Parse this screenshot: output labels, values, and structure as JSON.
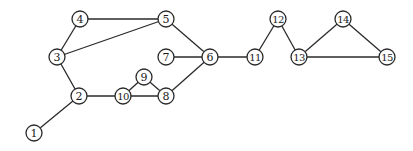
{
  "diagram": {
    "type": "undirected-graph",
    "nodes": [
      {
        "id": "1",
        "label": "1",
        "x": 34,
        "y": 133
      },
      {
        "id": "2",
        "label": "2",
        "x": 79,
        "y": 96
      },
      {
        "id": "3",
        "label": "3",
        "x": 57,
        "y": 57
      },
      {
        "id": "4",
        "label": "4",
        "x": 80,
        "y": 19
      },
      {
        "id": "5",
        "label": "5",
        "x": 166,
        "y": 19
      },
      {
        "id": "6",
        "label": "6",
        "x": 210,
        "y": 57
      },
      {
        "id": "7",
        "label": "7",
        "x": 166,
        "y": 57
      },
      {
        "id": "8",
        "label": "8",
        "x": 166,
        "y": 96
      },
      {
        "id": "9",
        "label": "9",
        "x": 144,
        "y": 77
      },
      {
        "id": "10",
        "label": "10",
        "x": 123,
        "y": 96
      },
      {
        "id": "11",
        "label": "11",
        "x": 255,
        "y": 57
      },
      {
        "id": "12",
        "label": "12",
        "x": 278,
        "y": 19
      },
      {
        "id": "13",
        "label": "13",
        "x": 299,
        "y": 57
      },
      {
        "id": "14",
        "label": "14",
        "x": 343,
        "y": 19
      },
      {
        "id": "15",
        "label": "15",
        "x": 387,
        "y": 57
      }
    ],
    "edges": [
      [
        "1",
        "2"
      ],
      [
        "2",
        "3"
      ],
      [
        "2",
        "10"
      ],
      [
        "3",
        "4"
      ],
      [
        "3",
        "5"
      ],
      [
        "4",
        "5"
      ],
      [
        "5",
        "6"
      ],
      [
        "6",
        "7"
      ],
      [
        "6",
        "8"
      ],
      [
        "6",
        "11"
      ],
      [
        "8",
        "10"
      ],
      [
        "9",
        "10"
      ],
      [
        "9",
        "8"
      ],
      [
        "11",
        "12"
      ],
      [
        "12",
        "13"
      ],
      [
        "13",
        "14"
      ],
      [
        "13",
        "15"
      ],
      [
        "14",
        "15"
      ]
    ],
    "node_radius": 8,
    "colors": {
      "stroke": "#2a2a2a",
      "fill": "#ffffff",
      "text": "#1a1a1a"
    }
  }
}
